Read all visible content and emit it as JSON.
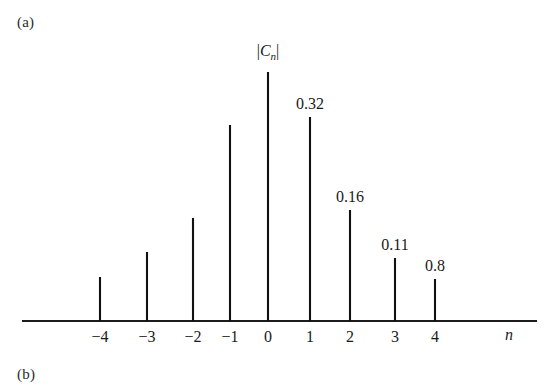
{
  "figure": {
    "panel_a_label": "(a)",
    "panel_b_label": "(b)"
  },
  "chart_data": {
    "type": "bar",
    "title": "",
    "subtitle": "",
    "xlabel": "n",
    "ylabel": "|Cn|",
    "ylabel_parts": {
      "bar_open": "|",
      "symbol": "C",
      "subscript": "n",
      "bar_close": "|"
    },
    "categories": [
      "-4",
      "-3",
      "-2",
      "-1",
      "0",
      "1",
      "2",
      "3",
      "4"
    ],
    "x": [
      -4,
      -3,
      -2,
      -1,
      0,
      1,
      2,
      3,
      4
    ],
    "values": [
      0.08,
      0.11,
      0.16,
      0.32,
      0.57,
      0.32,
      0.16,
      0.11,
      0.08
    ],
    "point_labels": [
      "",
      "",
      "",
      "",
      "",
      "0.32",
      "0.16",
      "0.11",
      "0.8"
    ],
    "tick_labels": [
      "−4",
      "−3",
      "−2",
      "−1",
      "0",
      "1",
      "2",
      "3",
      "4"
    ],
    "xlim": [
      -5.2,
      5.6
    ],
    "ylim": [
      0,
      0.6
    ],
    "grid": false,
    "legend": null,
    "axis_style": "single-horizontal-baseline-with-ticks",
    "stem_style": "vertical-impulse-lines"
  },
  "colors": {
    "background": "#ffffff",
    "stem": "#111111",
    "axis": "#1c1c1c",
    "text": "#1a1a1a"
  },
  "geometry": {
    "baseline_y": 321,
    "axis_x_start": 22,
    "axis_x_end": 537,
    "tick_x": [
      100,
      147,
      193,
      230,
      268,
      310,
      350,
      395,
      435
    ],
    "stem_top_y": [
      277,
      252,
      218,
      125,
      72,
      117,
      210,
      258,
      279
    ],
    "tick_length": 11,
    "label_y": 328,
    "value_label_y_offset": 22,
    "x_title_x": 505,
    "x_title_y": 326,
    "y_title_x": 268,
    "y_title_y": 42
  }
}
